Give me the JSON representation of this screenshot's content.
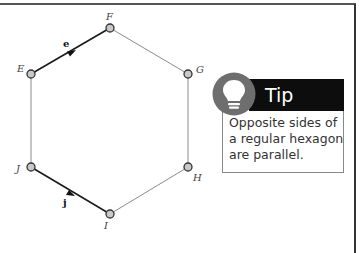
{
  "diagram": {
    "vertices": [
      {
        "name": "F",
        "x": 110,
        "y": 28,
        "label_x": 108,
        "label_y": 20
      },
      {
        "name": "G",
        "x": 188,
        "y": 74,
        "label_x": 197,
        "label_y": 72
      },
      {
        "name": "H",
        "x": 188,
        "y": 167,
        "label_x": 194,
        "label_y": 180
      },
      {
        "name": "I",
        "x": 110,
        "y": 214,
        "label_x": 104,
        "label_y": 229
      },
      {
        "name": "J",
        "x": 31,
        "y": 167,
        "label_x": 17,
        "label_y": 172
      },
      {
        "name": "E",
        "x": 31,
        "y": 74,
        "label_x": 18,
        "label_y": 71
      }
    ],
    "vectors": [
      {
        "label": "e",
        "from": "E",
        "to": "F"
      },
      {
        "label": "j",
        "from": "J",
        "to": "I"
      }
    ],
    "colors": {
      "vector_edge": "#1a1a1a",
      "plain_edge": "#8a8a8a",
      "vertex_fill": "#c8c8c8",
      "vertex_stroke": "#333333"
    }
  },
  "tip": {
    "title": "Tip",
    "text": "Opposite sides of a regular hexagon are parallel.",
    "icon": "lightbulb-icon",
    "colors": {
      "header": "#0d0d0d",
      "icon_circle": "#6e6e6e"
    }
  }
}
